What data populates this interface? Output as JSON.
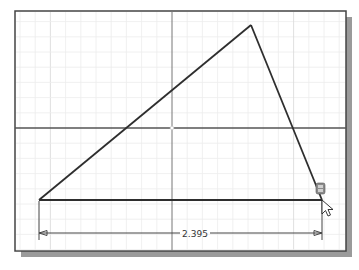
{
  "sketch": {
    "dimension_value": "2.395",
    "colors": {
      "background": "#ffffff",
      "grid_fine": "#ececec",
      "grid_major": "#d8d8d8",
      "axis": "#555555",
      "geometry": "#2e2e2e",
      "frame": "#444444",
      "shadow": "#9a9a9a",
      "dimension": "#444444"
    },
    "cursor": {
      "icon": "pointer-arrow-icon",
      "constraint_glyph": "coincident-constraint-icon"
    }
  }
}
